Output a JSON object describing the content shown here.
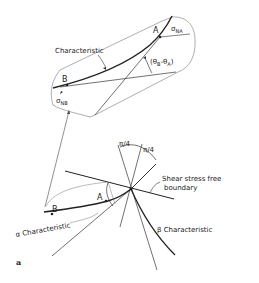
{
  "figure": {
    "panel_label": "a",
    "inset": {
      "characteristic_label": "Characteristic",
      "point_a": "A",
      "point_b": "B",
      "sigma_na": "σ",
      "sigma_na_sub": "NA",
      "sigma_nb": "σ",
      "sigma_nb_sub": "NB",
      "angle_label": "(θ",
      "angle_sub_b": "B",
      "angle_mid": "-θ",
      "angle_sub_a": "A",
      "angle_close": ")"
    },
    "main": {
      "pi4_left": "π/4",
      "pi4_right": "π/4",
      "boundary_label_line1": "Shear stress free",
      "boundary_label_line2": "boundary",
      "point_a": "A",
      "point_b": "B",
      "alpha_label": "α Characteristic",
      "beta_label": "β Characteristic"
    },
    "colors": {
      "line": "#222222",
      "thin_line": "#444444",
      "background": "#ffffff"
    }
  }
}
